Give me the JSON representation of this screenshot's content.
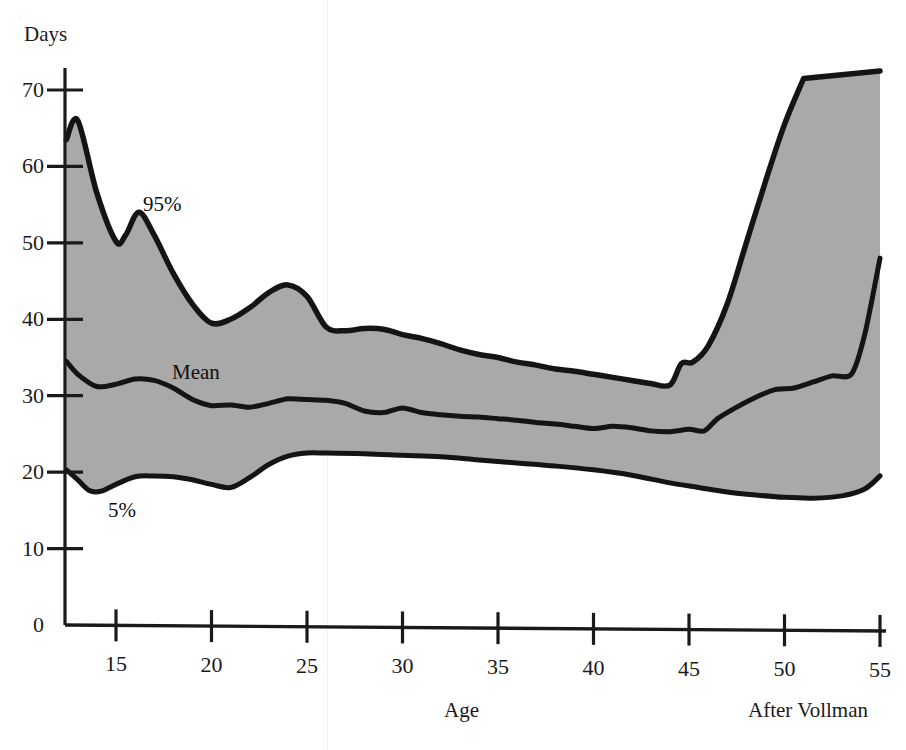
{
  "figure": {
    "y_axis_title": "Days",
    "x_axis_title": "Age",
    "source_note": "After Vollman"
  },
  "labels": {
    "upper": "95%",
    "middle": "Mean",
    "lower": "5%"
  },
  "colors": {
    "band_fill": "#a9a9a9",
    "curve": "#141414",
    "axis": "#1a1a1a",
    "background": "#ffffff"
  },
  "chart_data": {
    "type": "area",
    "title": "",
    "subtitle": "",
    "xlabel": "Age",
    "ylabel": "Days",
    "annotation": "After Vollman",
    "grid": false,
    "legend": "inline-labels",
    "xlim": [
      12.4,
      55
    ],
    "ylim": [
      0,
      72
    ],
    "xticks": [
      15,
      20,
      25,
      30,
      35,
      40,
      45,
      50,
      55
    ],
    "yticks": [
      0,
      10,
      20,
      30,
      40,
      50,
      60,
      70
    ],
    "series": [
      {
        "name": "95%",
        "x": [
          12.4,
          13.0,
          14.0,
          15.0,
          15.5,
          16.2,
          17.0,
          18.0,
          19.0,
          20.0,
          21.0,
          22.0,
          23.0,
          24.0,
          25.0,
          26.0,
          27.0,
          28.0,
          29.0,
          30.0,
          31.0,
          32.0,
          33.0,
          34.0,
          35.0,
          36.0,
          37.0,
          38.0,
          39.0,
          40.0,
          41.0,
          42.0,
          43.0,
          44.0,
          44.6,
          45.2,
          46.0,
          47.0,
          48.0,
          49.0,
          50.0,
          51.0
        ],
        "values": [
          63.5,
          66.0,
          56.5,
          50.2,
          51.0,
          54.0,
          51.0,
          46.0,
          42.0,
          39.5,
          40.0,
          41.5,
          43.5,
          44.5,
          43.0,
          39.0,
          38.5,
          38.8,
          38.7,
          38.0,
          37.5,
          36.8,
          36.0,
          35.4,
          35.0,
          34.4,
          34.0,
          33.5,
          33.2,
          32.8,
          32.4,
          32.0,
          31.6,
          31.4,
          34.2,
          34.4,
          36.5,
          42.0,
          50.0,
          58.0,
          65.5,
          71.5
        ]
      },
      {
        "name": "Mean",
        "x": [
          12.4,
          13.0,
          14.0,
          15.0,
          16.0,
          17.0,
          18.0,
          19.0,
          20.0,
          21.0,
          22.0,
          23.0,
          24.0,
          25.0,
          26.0,
          27.0,
          28.0,
          29.0,
          30.0,
          31.0,
          32.0,
          33.0,
          34.0,
          35.0,
          36.0,
          37.0,
          38.0,
          39.0,
          40.0,
          41.0,
          42.0,
          43.0,
          44.0,
          45.0,
          45.8,
          46.5,
          47.5,
          48.5,
          49.5,
          50.5,
          51.5,
          52.5,
          53.5,
          54.2,
          55.0
        ],
        "values": [
          34.5,
          32.8,
          31.2,
          31.5,
          32.2,
          32.0,
          31.0,
          29.5,
          28.7,
          28.8,
          28.5,
          29.0,
          29.6,
          29.5,
          29.4,
          29.0,
          28.0,
          27.8,
          28.4,
          27.8,
          27.5,
          27.3,
          27.2,
          27.0,
          26.8,
          26.5,
          26.3,
          26.0,
          25.7,
          26.0,
          25.8,
          25.4,
          25.3,
          25.6,
          25.4,
          27.0,
          28.5,
          29.8,
          30.8,
          31.0,
          31.8,
          32.6,
          32.8,
          38.0,
          48.0
        ]
      },
      {
        "name": "5%",
        "x": [
          12.4,
          13.0,
          13.6,
          14.2,
          15.0,
          16.0,
          17.0,
          18.0,
          19.0,
          20.0,
          21.0,
          22.0,
          23.0,
          24.0,
          25.0,
          26.0,
          28.0,
          30.0,
          32.0,
          34.0,
          36.0,
          38.0,
          40.0,
          42.0,
          44.0,
          45.5,
          47.0,
          48.5,
          50.0,
          51.5,
          53.0,
          54.2,
          55.0
        ],
        "values": [
          20.3,
          19.0,
          17.6,
          17.5,
          18.4,
          19.4,
          19.5,
          19.4,
          19.0,
          18.4,
          18.0,
          19.3,
          21.0,
          22.1,
          22.5,
          22.5,
          22.4,
          22.2,
          22.0,
          21.6,
          21.2,
          20.8,
          20.3,
          19.6,
          18.6,
          18.0,
          17.4,
          17.0,
          16.7,
          16.6,
          16.9,
          17.8,
          19.5
        ]
      }
    ]
  }
}
